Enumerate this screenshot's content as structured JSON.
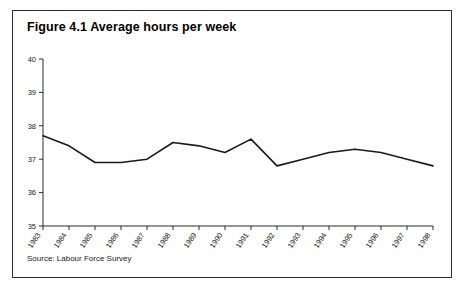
{
  "figure": {
    "title": "Figure 4.1 Average hours per week",
    "source": "Source: Labour Force Survey"
  },
  "chart_data": {
    "type": "line",
    "title": "Figure 4.1 Average hours per week",
    "xlabel": "",
    "ylabel": "",
    "categories": [
      "1983",
      "1984",
      "1985",
      "1986",
      "1987",
      "1988",
      "1989",
      "1990",
      "1991",
      "1992",
      "1993",
      "1994",
      "1995",
      "1996",
      "1997",
      "1998"
    ],
    "values": [
      37.7,
      37.4,
      36.9,
      36.9,
      37.0,
      37.5,
      37.4,
      37.2,
      37.6,
      36.8,
      37.0,
      37.2,
      37.3,
      37.2,
      37.0,
      36.8
    ],
    "series": [
      {
        "name": "Average hours per week",
        "values": [
          37.7,
          37.4,
          36.9,
          36.9,
          37.0,
          37.5,
          37.4,
          37.2,
          37.6,
          36.8,
          37.0,
          37.2,
          37.3,
          37.2,
          37.0,
          36.8
        ]
      }
    ],
    "ylim": [
      35,
      40
    ],
    "yticks": [
      35,
      36,
      37,
      38,
      39,
      40
    ],
    "ytick_labels": [
      "35",
      "36",
      "37",
      "38",
      "39",
      "40"
    ],
    "xlim": [
      "1983",
      "1998"
    ],
    "grid": false,
    "legend": "none",
    "line_color": "#1a1a1a",
    "axis_color": "#2b2b2b"
  }
}
